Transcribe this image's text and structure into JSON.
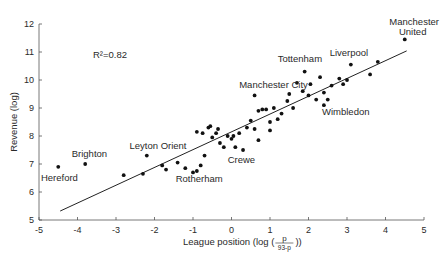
{
  "chart_data": {
    "type": "scatter",
    "title": "",
    "xlabel": "League position (log (p/(93-p)))",
    "xlabel_parts": {
      "prefix": "League position (log (",
      "num": "p",
      "den": "93-p",
      "suffix": "))"
    },
    "ylabel": "Revenue (log)",
    "xlim": [
      -5,
      5
    ],
    "ylim": [
      5,
      12
    ],
    "xticks": [
      -5,
      -4,
      -3,
      -2,
      -1,
      0,
      1,
      2,
      3,
      4,
      5
    ],
    "yticks": [
      5,
      6,
      7,
      8,
      9,
      10,
      11,
      12
    ],
    "grid": false,
    "legend": null,
    "annotation": {
      "text": "R²=0.82",
      "x": -3.6,
      "y": 10.8
    },
    "regression_line": {
      "x": [
        -4.45,
        4.55
      ],
      "y": [
        5.32,
        11.04
      ],
      "r_squared": 0.82
    },
    "labeled_points": [
      {
        "label": "Hereford",
        "x": -4.5,
        "y": 6.9
      },
      {
        "label": "Brighton",
        "x": -3.8,
        "y": 7.0
      },
      {
        "label": "Leyton Orient",
        "x": -2.2,
        "y": 7.3
      },
      {
        "label": "Rotherham",
        "x": -0.8,
        "y": 6.95
      },
      {
        "label": "Crewe",
        "x": 0.1,
        "y": 7.6
      },
      {
        "label": "Manchester City",
        "x": 0.6,
        "y": 9.45
      },
      {
        "label": "Tottenham",
        "x": 1.9,
        "y": 10.3
      },
      {
        "label": "Wimbledon",
        "x": 2.4,
        "y": 9.1
      },
      {
        "label": "Liverpool",
        "x": 3.1,
        "y": 10.55
      },
      {
        "label": "Manchester United",
        "x": 4.5,
        "y": 11.45
      }
    ],
    "points": [
      [
        -4.5,
        6.9
      ],
      [
        -3.8,
        7.0
      ],
      [
        -2.2,
        7.3
      ],
      [
        -2.8,
        6.6
      ],
      [
        -2.3,
        6.65
      ],
      [
        -1.8,
        6.95
      ],
      [
        -1.7,
        6.8
      ],
      [
        -1.4,
        7.05
      ],
      [
        -1.2,
        6.85
      ],
      [
        -1.0,
        6.7
      ],
      [
        -0.9,
        6.75
      ],
      [
        -0.8,
        6.95
      ],
      [
        -0.7,
        7.3
      ],
      [
        -0.9,
        8.15
      ],
      [
        -0.75,
        8.1
      ],
      [
        -0.6,
        8.3
      ],
      [
        -0.55,
        8.35
      ],
      [
        -0.5,
        7.95
      ],
      [
        -0.4,
        8.1
      ],
      [
        -0.35,
        8.25
      ],
      [
        -0.3,
        7.75
      ],
      [
        -0.2,
        7.6
      ],
      [
        -0.1,
        8.0
      ],
      [
        0.0,
        7.9
      ],
      [
        0.05,
        8.0
      ],
      [
        0.1,
        7.6
      ],
      [
        0.2,
        8.1
      ],
      [
        0.3,
        7.5
      ],
      [
        0.4,
        8.3
      ],
      [
        0.5,
        8.55
      ],
      [
        0.6,
        8.25
      ],
      [
        0.7,
        7.85
      ],
      [
        0.7,
        8.9
      ],
      [
        0.9,
        8.95
      ],
      [
        1.0,
        8.5
      ],
      [
        0.6,
        9.45
      ],
      [
        0.8,
        8.95
      ],
      [
        1.0,
        8.2
      ],
      [
        1.1,
        9.0
      ],
      [
        1.2,
        8.6
      ],
      [
        1.3,
        8.8
      ],
      [
        1.45,
        9.25
      ],
      [
        1.6,
        9.0
      ],
      [
        1.5,
        9.5
      ],
      [
        1.85,
        9.6
      ],
      [
        2.0,
        9.45
      ],
      [
        2.05,
        9.85
      ],
      [
        2.2,
        9.3
      ],
      [
        1.7,
        9.9
      ],
      [
        2.3,
        10.1
      ],
      [
        2.5,
        9.3
      ],
      [
        2.6,
        9.8
      ],
      [
        2.4,
        9.55
      ],
      [
        1.9,
        10.3
      ],
      [
        2.4,
        9.1
      ],
      [
        2.8,
        10.05
      ],
      [
        2.9,
        9.85
      ],
      [
        3.0,
        10.0
      ],
      [
        3.1,
        10.55
      ],
      [
        3.6,
        10.2
      ],
      [
        3.8,
        10.65
      ],
      [
        4.5,
        11.45
      ]
    ],
    "label_positions": {
      "Hereford": [
        -4.95,
        6.4
      ],
      "Brighton": [
        -4.15,
        7.25
      ],
      "Leyton Orient": [
        -2.65,
        7.55
      ],
      "Rotherham": [
        -1.45,
        6.35
      ],
      "Crewe": [
        -0.1,
        7.05
      ],
      "Manchester City": [
        0.2,
        9.7
      ],
      "Tottenham": [
        1.2,
        10.65
      ],
      "Wimbledon": [
        2.35,
        8.75
      ],
      "Liverpool": [
        2.55,
        10.85
      ],
      "Manchester United": [
        4.1,
        11.95
      ],
      "Manchester United line2": [
        4.35,
        11.6
      ]
    }
  },
  "plot": {
    "colors": {
      "axis": "#555555",
      "point": "#111111",
      "line": "#222222",
      "text": "#2a2a2a"
    }
  }
}
